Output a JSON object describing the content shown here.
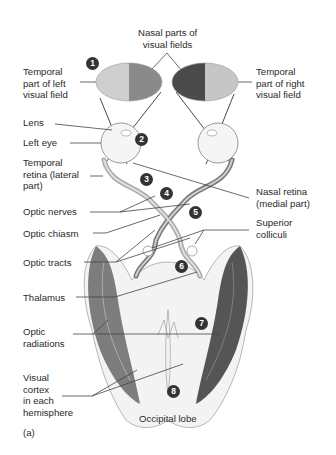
{
  "diagram": {
    "panel_label": "(a)",
    "labels": {
      "nasal_parts": "Nasal parts of\nvisual fields",
      "temporal_left": "Temporal\npart of left\nvisual field",
      "temporal_right": "Temporal\npart of right\nvisual field",
      "lens": "Lens",
      "left_eye": "Left eye",
      "temporal_retina": "Temporal\nretina (lateral\npart)",
      "nasal_retina": "Nasal retina\n(medial part)",
      "optic_nerves": "Optic nerves",
      "optic_chiasm": "Optic chiasm",
      "superior_colliculi": "Superior\ncolliculi",
      "optic_tracts": "Optic tracts",
      "thalamus": "Thalamus",
      "optic_radiations": "Optic\nradiations",
      "visual_cortex": "Visual\ncortex\nin each\nhemisphere",
      "occipital_lobe": "Occipital lobe"
    },
    "step_numbers": [
      "1",
      "2",
      "3",
      "4",
      "5",
      "6",
      "7",
      "8"
    ],
    "colors": {
      "left_field_temporal": "#cfcfcf",
      "left_field_nasal": "#8a8a8a",
      "right_field_nasal": "#4a4a4a",
      "right_field_temporal": "#c6c6c6",
      "badge": "#333333",
      "tissue": "#e8e8e8",
      "radiation_dark": "#5a5a5a"
    }
  }
}
